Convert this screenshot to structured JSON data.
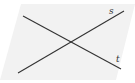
{
  "diagram": {
    "type": "geometry",
    "plane": {
      "points": "21,4 135,4 116,80 0,80",
      "fill": "#f2f2f2"
    },
    "lines": [
      {
        "label": "s",
        "x1": 18,
        "y1": 73,
        "x2": 124,
        "y2": 11,
        "label_x": 109,
        "label_y": 14
      },
      {
        "label": "t",
        "x1": 23,
        "y1": 16,
        "x2": 121,
        "y2": 69,
        "label_x": 116,
        "label_y": 62
      }
    ],
    "line_color": "#333333",
    "intersection": {
      "x": 70,
      "y": 42
    }
  }
}
